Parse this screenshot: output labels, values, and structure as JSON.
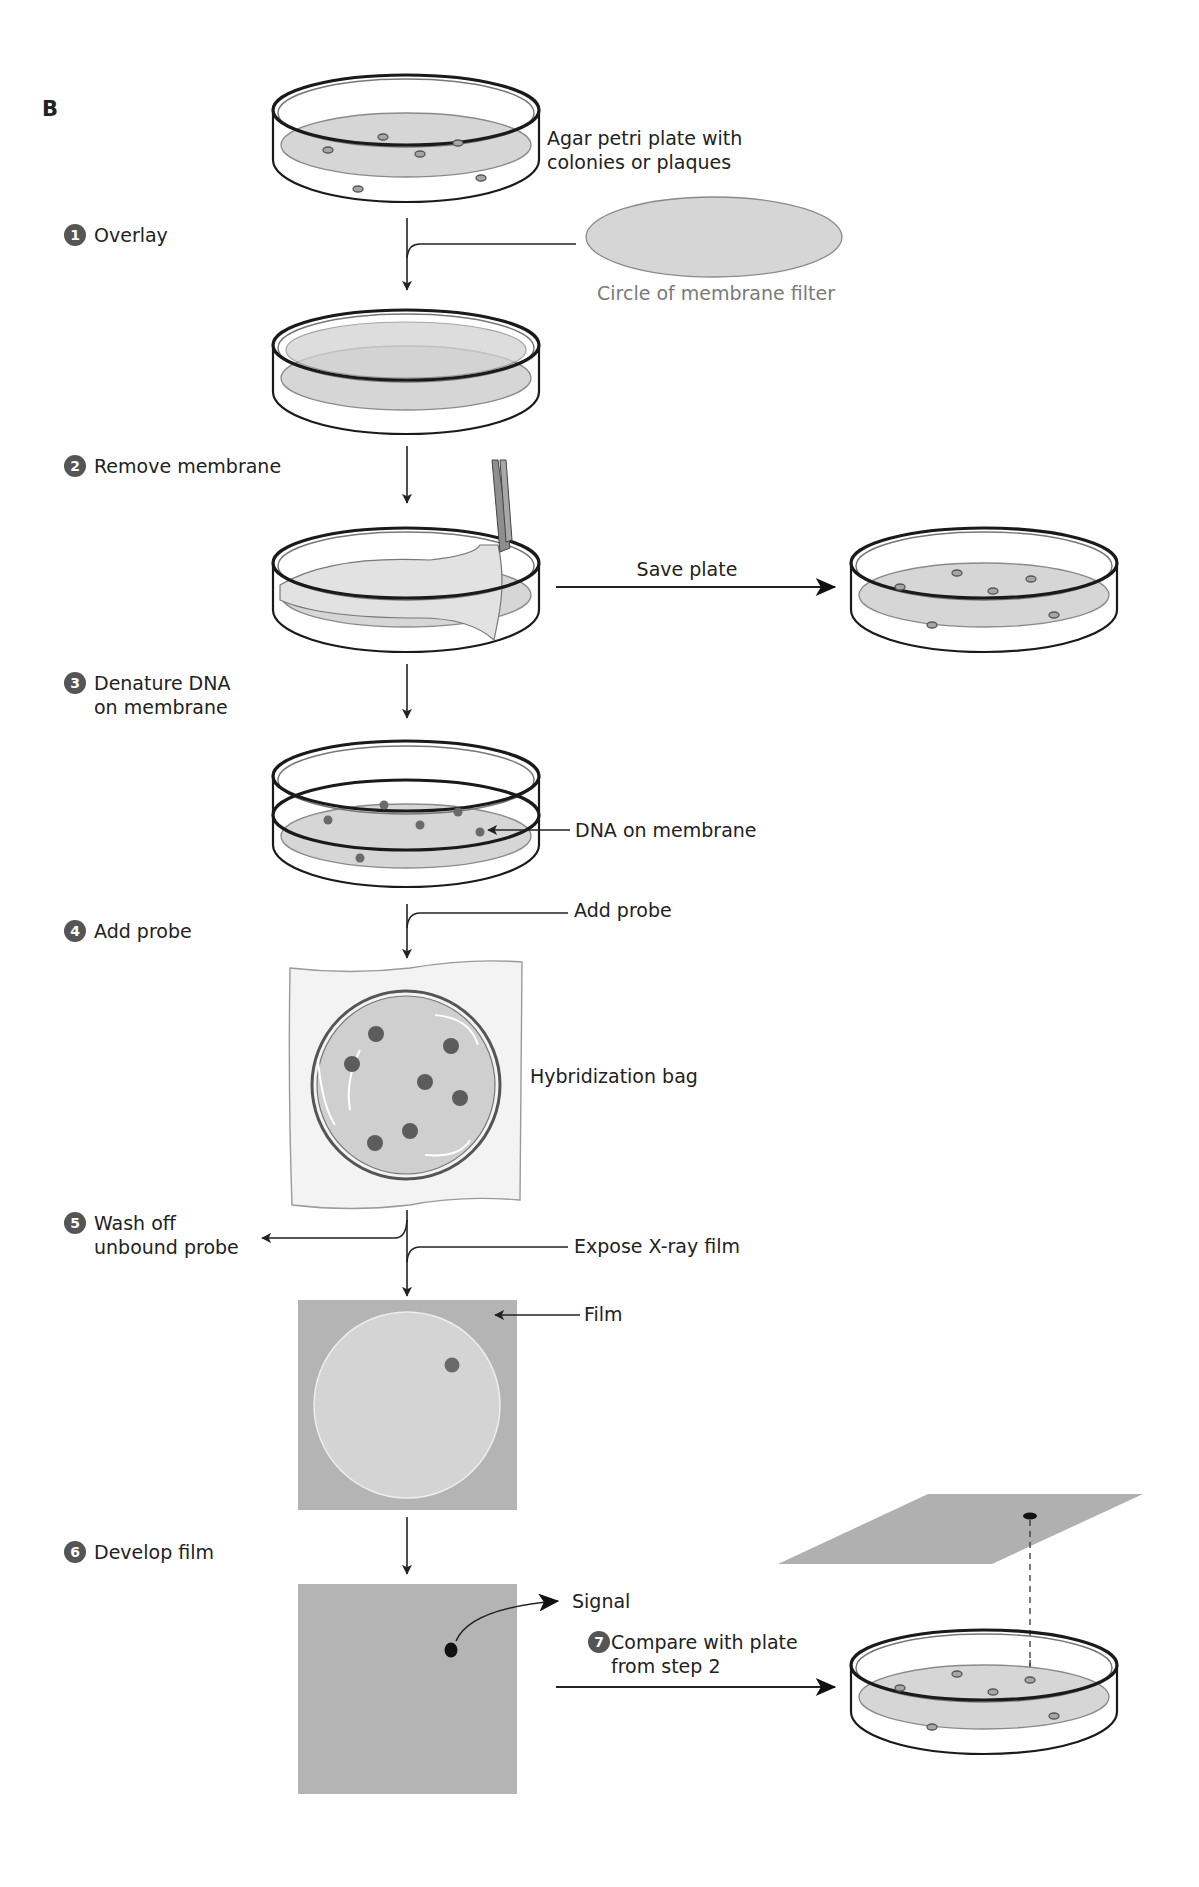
{
  "panel_label": "B",
  "steps": [
    {
      "number": "1",
      "label_lines": [
        "Overlay"
      ]
    },
    {
      "number": "2",
      "label_lines": [
        "Remove membrane"
      ]
    },
    {
      "number": "3",
      "label_lines": [
        "Denature DNA",
        "on membrane"
      ]
    },
    {
      "number": "4",
      "label_lines": [
        "Add probe"
      ]
    },
    {
      "number": "5",
      "label_lines": [
        "Wash off",
        "unbound probe"
      ]
    },
    {
      "number": "6",
      "label_lines": [
        "Develop film"
      ]
    },
    {
      "number": "7",
      "label_lines": [
        "Compare with plate",
        "from step 2"
      ]
    }
  ],
  "annotations": {
    "agar_plate": [
      "Agar petri plate with",
      "colonies or plaques"
    ],
    "membrane_filter": "Circle of membrane filter",
    "save_plate": "Save plate",
    "dna_on_membrane": "DNA on membrane",
    "add_probe": "Add probe",
    "hybridization_bag": "Hybridization bag",
    "expose_film": "Expose X-ray film",
    "film": "Film",
    "signal": "Signal"
  },
  "colors": {
    "step_badge": "#555555",
    "agar": "#d6d6d6",
    "film": "#b4b4b4",
    "film_circle": "#d4d4d4",
    "probe_spot": "#6a6a6a",
    "signal_spot": "#111111",
    "caption_gray": "#7a7a7a"
  }
}
